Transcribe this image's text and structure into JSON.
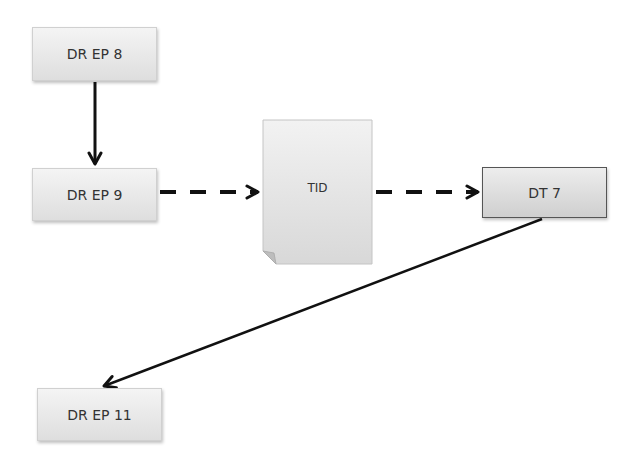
{
  "diagram": {
    "nodes": [
      {
        "id": "dr-ep-8",
        "label": "DR EP 8",
        "shape": "box"
      },
      {
        "id": "dr-ep-9",
        "label": "DR EP 9",
        "shape": "box"
      },
      {
        "id": "tid",
        "label": "TID",
        "shape": "document"
      },
      {
        "id": "dt-7",
        "label": "DT 7",
        "shape": "box"
      },
      {
        "id": "dr-ep-11",
        "label": "DR EP 11",
        "shape": "box"
      }
    ],
    "edges": [
      {
        "from": "dr-ep-8",
        "to": "dr-ep-9",
        "style": "solid"
      },
      {
        "from": "dr-ep-9",
        "to": "tid",
        "style": "dashed"
      },
      {
        "from": "tid",
        "to": "dt-7",
        "style": "dashed"
      },
      {
        "from": "dt-7",
        "to": "dr-ep-11",
        "style": "solid"
      }
    ],
    "colors": {
      "box_fill_top": "#f4f4f4",
      "box_fill_bottom": "#dedede",
      "line": "#111111",
      "text": "#333333"
    }
  }
}
